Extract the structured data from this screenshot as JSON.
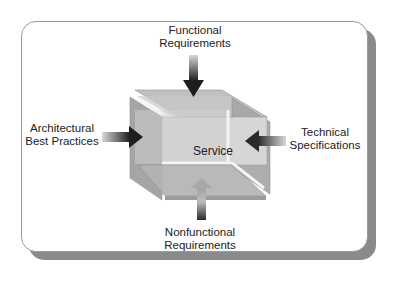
{
  "diagram": {
    "center_label": "Service",
    "inputs": [
      {
        "position": "top",
        "label_line1": "Functional",
        "label_line2": "Requirements",
        "arrow_direction": "down"
      },
      {
        "position": "left",
        "label_line1": "Architectural",
        "label_line2": "Best Practices",
        "arrow_direction": "right"
      },
      {
        "position": "right",
        "label_line1": "Technical",
        "label_line2": "Specifications",
        "arrow_direction": "left"
      },
      {
        "position": "bottom",
        "label_line1": "Nonfunctional",
        "label_line2": "Requirements",
        "arrow_direction": "up"
      }
    ]
  },
  "colors": {
    "frame_border": "#9a9a9a",
    "frame_shadow": "#8a8a8a",
    "cube_face": "#b8b8b8",
    "cube_face_dark": "#9c9c9c",
    "arrow_dark": "#1e1e1e",
    "arrow_light": "#d8d8d8"
  }
}
